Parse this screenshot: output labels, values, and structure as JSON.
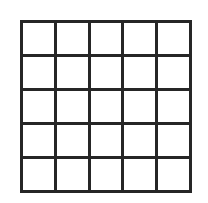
{
  "figure": {
    "kind": "grid-of-squares",
    "title": "",
    "rows": 5,
    "columns": 5,
    "cell_count": 25,
    "background_color": "#ffffff",
    "line_color": "#262626",
    "line_width_px": 3,
    "geometry": {
      "left_px": 20,
      "top_px": 20,
      "width_px": 172,
      "height_px": 173,
      "cell_width_px": 34,
      "cell_height_px": 34
    },
    "cells": [
      {
        "row": 1,
        "col": 1,
        "label": "",
        "fill": "#ffffff"
      },
      {
        "row": 1,
        "col": 2,
        "label": "",
        "fill": "#ffffff"
      },
      {
        "row": 1,
        "col": 3,
        "label": "",
        "fill": "#ffffff"
      },
      {
        "row": 1,
        "col": 4,
        "label": "",
        "fill": "#ffffff"
      },
      {
        "row": 1,
        "col": 5,
        "label": "",
        "fill": "#ffffff"
      },
      {
        "row": 2,
        "col": 1,
        "label": "",
        "fill": "#ffffff"
      },
      {
        "row": 2,
        "col": 2,
        "label": "",
        "fill": "#ffffff"
      },
      {
        "row": 2,
        "col": 3,
        "label": "",
        "fill": "#ffffff"
      },
      {
        "row": 2,
        "col": 4,
        "label": "",
        "fill": "#ffffff"
      },
      {
        "row": 2,
        "col": 5,
        "label": "",
        "fill": "#ffffff"
      },
      {
        "row": 3,
        "col": 1,
        "label": "",
        "fill": "#ffffff"
      },
      {
        "row": 3,
        "col": 2,
        "label": "",
        "fill": "#ffffff"
      },
      {
        "row": 3,
        "col": 3,
        "label": "",
        "fill": "#ffffff"
      },
      {
        "row": 3,
        "col": 4,
        "label": "",
        "fill": "#ffffff"
      },
      {
        "row": 3,
        "col": 5,
        "label": "",
        "fill": "#ffffff"
      },
      {
        "row": 4,
        "col": 1,
        "label": "",
        "fill": "#ffffff"
      },
      {
        "row": 4,
        "col": 2,
        "label": "",
        "fill": "#ffffff"
      },
      {
        "row": 4,
        "col": 3,
        "label": "",
        "fill": "#ffffff"
      },
      {
        "row": 4,
        "col": 4,
        "label": "",
        "fill": "#ffffff"
      },
      {
        "row": 4,
        "col": 5,
        "label": "",
        "fill": "#ffffff"
      },
      {
        "row": 5,
        "col": 1,
        "label": "",
        "fill": "#ffffff"
      },
      {
        "row": 5,
        "col": 2,
        "label": "",
        "fill": "#ffffff"
      },
      {
        "row": 5,
        "col": 3,
        "label": "",
        "fill": "#ffffff"
      },
      {
        "row": 5,
        "col": 4,
        "label": "",
        "fill": "#ffffff"
      },
      {
        "row": 5,
        "col": 5,
        "label": "",
        "fill": "#ffffff"
      }
    ]
  }
}
